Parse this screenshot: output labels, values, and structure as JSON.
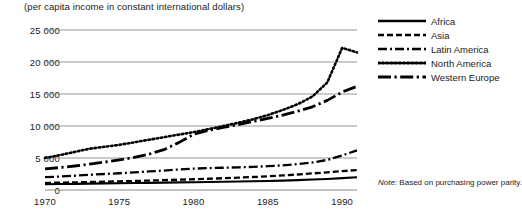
{
  "chart_data": {
    "type": "line",
    "title": "",
    "subtitle": "(per capita income in constant international dollars)",
    "xlabel": "",
    "ylabel": "",
    "xlim": [
      1970,
      1991
    ],
    "ylim": [
      0,
      25000
    ],
    "grid": true,
    "legend_position": "right",
    "note_prefix": "Note:",
    "note_text": "Based on purchasing power parity.",
    "x_ticks": [
      "1970",
      "1975",
      "1980",
      "1985",
      "1990"
    ],
    "x_tick_values": [
      1970,
      1975,
      1980,
      1985,
      1990
    ],
    "y_ticks": [
      "0",
      "5 000",
      "10 000",
      "15 000",
      "20 000",
      "25 000"
    ],
    "y_tick_values": [
      0,
      5000,
      10000,
      15000,
      20000,
      25000
    ],
    "x": [
      1970,
      1971,
      1972,
      1973,
      1974,
      1975,
      1976,
      1977,
      1978,
      1979,
      1980,
      1981,
      1982,
      1983,
      1984,
      1985,
      1986,
      1987,
      1988,
      1989,
      1990,
      1991
    ],
    "series": [
      {
        "name": "Africa",
        "style": "solid",
        "values": [
          900,
          930,
          955,
          990,
          1030,
          1060,
          1090,
          1120,
          1150,
          1190,
          1220,
          1250,
          1280,
          1320,
          1360,
          1410,
          1470,
          1540,
          1630,
          1730,
          1860,
          2000
        ]
      },
      {
        "name": "Asia",
        "style": "dashed",
        "values": [
          1100,
          1150,
          1190,
          1250,
          1300,
          1350,
          1410,
          1470,
          1540,
          1610,
          1680,
          1760,
          1840,
          1930,
          2030,
          2140,
          2270,
          2420,
          2590,
          2760,
          2940,
          3120
        ]
      },
      {
        "name": "Latin America",
        "style": "dashdot",
        "values": [
          2000,
          2110,
          2230,
          2370,
          2500,
          2620,
          2760,
          2900,
          3040,
          3200,
          3340,
          3420,
          3480,
          3540,
          3620,
          3720,
          3860,
          4050,
          4300,
          4700,
          5400,
          6200
        ]
      },
      {
        "name": "North America",
        "style": "dotted",
        "values": [
          5000,
          5450,
          5950,
          6450,
          6750,
          7050,
          7450,
          7850,
          8250,
          8650,
          9050,
          9500,
          10000,
          10500,
          11050,
          11700,
          12500,
          13400,
          14600,
          16800,
          22200,
          21500
        ]
      },
      {
        "name": "Western Europe",
        "style": "longdashdot",
        "values": [
          3300,
          3500,
          3750,
          4050,
          4350,
          4700,
          5100,
          5600,
          6300,
          7400,
          8700,
          9300,
          9800,
          10200,
          10700,
          11200,
          11700,
          12300,
          13000,
          14000,
          15300,
          16200
        ]
      }
    ]
  },
  "legend": {
    "items": [
      {
        "label": "Africa"
      },
      {
        "label": "Asia"
      },
      {
        "label": "Latin America"
      },
      {
        "label": "North America"
      },
      {
        "label": "Western Europe"
      }
    ]
  }
}
